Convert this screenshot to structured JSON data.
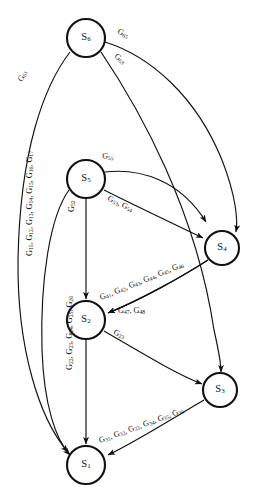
{
  "diagram": {
    "type": "directed-graph",
    "colors": {
      "background": "#ffffff",
      "stroke": "#111111",
      "node_fill": "#ffffff"
    },
    "nodes": [
      {
        "id": "S6",
        "label": "S",
        "sub": "6",
        "cx": 86,
        "cy": 38,
        "r": 19
      },
      {
        "id": "S5",
        "label": "S",
        "sub": "5",
        "cx": 86,
        "cy": 179,
        "r": 19
      },
      {
        "id": "S4",
        "label": "S",
        "sub": "4",
        "cx": 222,
        "cy": 248,
        "r": 17
      },
      {
        "id": "S2",
        "label": "S",
        "sub": "2",
        "cx": 86,
        "cy": 320,
        "r": 19
      },
      {
        "id": "S3",
        "label": "S",
        "sub": "3",
        "cx": 220,
        "cy": 390,
        "r": 17
      },
      {
        "id": "S1",
        "label": "S",
        "sub": "1",
        "cx": 86,
        "cy": 465,
        "r": 19
      }
    ],
    "edges": [
      {
        "id": "e-s6-s1",
        "from": "S6",
        "to": "S1",
        "label": "G61",
        "label_parts": [
          {
            "base": "G",
            "sub": "61"
          }
        ],
        "label_x": 22,
        "label_y": 82,
        "rotate": -62,
        "path": "M 70 52 C 44 86, 20 150, 18 260 C 17 350, 40 420, 68 452"
      },
      {
        "id": "e-s6-s5-right",
        "from": "S6",
        "to": "S4",
        "label": "G65",
        "label_parts": [
          {
            "base": "G",
            "sub": "65"
          }
        ],
        "label_x": 117,
        "label_y": 33,
        "rotate": 27,
        "path": "M 105 42 C 150 56, 196 96, 222 160 C 236 196, 238 220, 236 232"
      },
      {
        "id": "e-s6-s3",
        "from": "S6",
        "to": "S3",
        "label": "G63",
        "label_parts": [
          {
            "base": "G",
            "sub": "63"
          }
        ],
        "label_x": 114,
        "label_y": 57,
        "rotate": 40,
        "path": "M 101 52 C 140 110, 196 210, 214 330 C 219 352, 221 368, 221 372"
      },
      {
        "id": "e-s5-s4",
        "from": "S5",
        "to": "S4",
        "label": "G55",
        "label_parts": [
          {
            "base": "G",
            "sub": "55"
          }
        ],
        "label_x": 102,
        "label_y": 158,
        "rotate": 7,
        "path": "M 105 172 C 140 168, 180 180, 206 222"
      },
      {
        "id": "e-s5-s4-b",
        "from": "S5",
        "to": "S4",
        "label": "G53, G54",
        "label_parts": [
          {
            "base": "G",
            "sub": "53"
          },
          {
            "base": ", G",
            "sub": "54"
          }
        ],
        "label_x": 107,
        "label_y": 200,
        "rotate": 26,
        "path": "M 104 190 C 140 208, 178 226, 203 238"
      },
      {
        "id": "e-s5-s2",
        "from": "S5",
        "to": "S2",
        "label": "G52",
        "label_parts": [
          {
            "base": "G",
            "sub": "52"
          }
        ],
        "label_x": 74,
        "label_y": 212,
        "rotate": -90,
        "path": "M 86 198 L 86 299"
      },
      {
        "id": "e-s4-s2",
        "from": "S4",
        "to": "S2",
        "label": "G41, G42, G43, G44, G45, G46",
        "label_parts": [
          {
            "base": "G",
            "sub": "41"
          },
          {
            "base": ", G",
            "sub": "42"
          },
          {
            "base": ", G",
            "sub": "43"
          },
          {
            "base": ", G",
            "sub": "44"
          },
          {
            "base": ", G",
            "sub": "45"
          },
          {
            "base": ", G",
            "sub": "46"
          }
        ],
        "label_x": 101,
        "label_y": 300,
        "rotate": -22,
        "path": "M 208 260 C 180 278, 140 300, 108 313"
      },
      {
        "id": "e-s4-s2-b",
        "from": "S4",
        "to": "S2",
        "label": "G47, G48",
        "label_parts": [
          {
            "base": "G",
            "sub": "47"
          },
          {
            "base": ", G",
            "sub": "48"
          }
        ],
        "label_x": 118,
        "label_y": 313,
        "rotate": 0,
        "path": "M 208 260 C 180 278, 140 300, 108 313"
      },
      {
        "id": "e-s2-s3",
        "from": "S2",
        "to": "S3",
        "label": "G23",
        "label_parts": [
          {
            "base": "G",
            "sub": "23"
          }
        ],
        "label_x": 113,
        "label_y": 334,
        "rotate": 24,
        "path": "M 104 331 C 140 352, 176 374, 202 384"
      },
      {
        "id": "e-s2-s1",
        "from": "S2",
        "to": "S1",
        "label": "G22, G23, G24, G25, G26",
        "label_parts": [
          {
            "base": "G",
            "sub": "22"
          },
          {
            "base": ", G",
            "sub": "23"
          },
          {
            "base": ", G",
            "sub": "24"
          },
          {
            "base": ", G",
            "sub": "25"
          },
          {
            "base": ", G",
            "sub": "26"
          }
        ],
        "label_x": 72,
        "label_y": 370,
        "rotate": -90,
        "path": "M 86 339 L 86 444"
      },
      {
        "id": "e-s3-s1",
        "from": "S3",
        "to": "S1",
        "label": "G31, G32, G33, G34, G35, G36",
        "label_parts": [
          {
            "base": "G",
            "sub": "31"
          },
          {
            "base": ", G",
            "sub": "32"
          },
          {
            "base": ", G",
            "sub": "33"
          },
          {
            "base": ", G",
            "sub": "34"
          },
          {
            "base": ", G",
            "sub": "35"
          },
          {
            "base": ", G",
            "sub": "36"
          }
        ],
        "label_x": 100,
        "label_y": 443,
        "rotate": -20,
        "path": "M 204 400 C 170 420, 135 442, 108 455"
      },
      {
        "id": "e-s5-s1-left",
        "from": "S5",
        "to": "S1",
        "label": "G11, G12, G13, G14, G15, G16, G17",
        "label_parts": [
          {
            "base": "G",
            "sub": "11"
          },
          {
            "base": ", G",
            "sub": "12"
          },
          {
            "base": ", G",
            "sub": "13"
          },
          {
            "base": ", G",
            "sub": "14"
          },
          {
            "base": ", G",
            "sub": "15"
          },
          {
            "base": ", G",
            "sub": "16"
          },
          {
            "base": ", G",
            "sub": "17"
          }
        ],
        "label_x": 32,
        "label_y": 256,
        "rotate": -90,
        "path": "M 69 190 C 50 216, 40 280, 42 350 C 44 406, 56 440, 70 455"
      }
    ]
  }
}
